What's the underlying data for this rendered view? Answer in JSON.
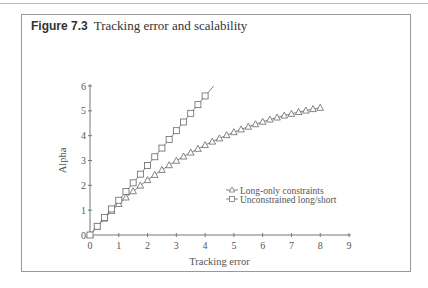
{
  "figure": {
    "number": "Figure 7.3",
    "title": "Tracking error and scalability"
  },
  "chart_data": {
    "type": "line",
    "title": "Tracking error and scalability",
    "xlabel": "Tracking error",
    "ylabel": "Alpha",
    "xlim": [
      0,
      9
    ],
    "ylim": [
      0,
      6
    ],
    "xticks": [
      0,
      1,
      2,
      3,
      4,
      5,
      6,
      7,
      8,
      9
    ],
    "yticks": [
      0,
      1,
      2,
      3,
      4,
      5,
      6
    ],
    "grid": false,
    "legend_position": "center-right",
    "series": [
      {
        "name": "Long-only constraints",
        "marker": "triangle",
        "x": [
          0,
          0.25,
          0.5,
          0.75,
          1,
          1.25,
          1.5,
          1.75,
          2,
          2.25,
          2.5,
          2.75,
          3,
          3.25,
          3.5,
          3.75,
          4,
          4.25,
          4.5,
          4.75,
          5,
          5.25,
          5.5,
          5.75,
          6,
          6.25,
          6.5,
          6.75,
          7,
          7.25,
          7.5,
          7.75,
          8
        ],
        "y": [
          0,
          0.34,
          0.66,
          0.97,
          1.25,
          1.51,
          1.76,
          1.99,
          2.21,
          2.42,
          2.62,
          2.81,
          2.99,
          3.16,
          3.32,
          3.47,
          3.62,
          3.76,
          3.89,
          4.02,
          4.14,
          4.25,
          4.36,
          4.46,
          4.56,
          4.65,
          4.73,
          4.81,
          4.88,
          4.95,
          5.01,
          5.07,
          5.12
        ]
      },
      {
        "name": "Unconstrained long/short",
        "marker": "square",
        "x": [
          0,
          0.25,
          0.5,
          0.75,
          1,
          1.25,
          1.5,
          1.75,
          2,
          2.25,
          2.5,
          2.75,
          3,
          3.25,
          3.5,
          3.75,
          4
        ],
        "y": [
          0,
          0.35,
          0.7,
          1.05,
          1.4,
          1.75,
          2.1,
          2.45,
          2.8,
          3.15,
          3.5,
          3.85,
          4.2,
          4.55,
          4.9,
          5.25,
          5.6
        ],
        "line_extends_to": [
          4.3,
          6.0
        ]
      }
    ]
  }
}
